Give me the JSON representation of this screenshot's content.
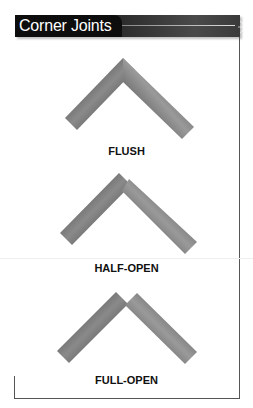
{
  "header": {
    "title": "Corner Joints"
  },
  "joints": [
    {
      "label": "FLUSH",
      "type": "flush"
    },
    {
      "label": "HALF-OPEN",
      "type": "half-open"
    },
    {
      "label": "FULL-OPEN",
      "type": "full-open"
    }
  ],
  "colors": {
    "header_bg": "#111111",
    "bar_dark": "#2b2b2b",
    "bar_light": "#9a9a9a",
    "frame": "#555555"
  }
}
